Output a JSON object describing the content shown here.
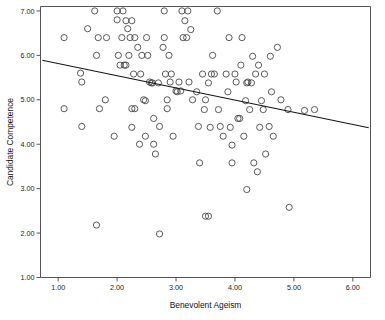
{
  "chart_data": {
    "type": "scatter",
    "title": "",
    "xlabel": "Benevolent Ageism",
    "ylabel": "Candidate Competence",
    "xlim": [
      0.7,
      6.3
    ],
    "ylim": [
      1.0,
      7.1
    ],
    "grid": false,
    "legend": null,
    "xticks": [
      "1.00",
      "2.00",
      "3.00",
      "4.00",
      "5.00",
      "6.00"
    ],
    "xtick_values": [
      1.0,
      2.0,
      3.0,
      4.0,
      5.0,
      6.0
    ],
    "yticks": [
      "1.00",
      "2.00",
      "3.00",
      "4.00",
      "5.00",
      "6.00",
      "7.00"
    ],
    "ytick_values": [
      1.0,
      2.0,
      3.0,
      4.0,
      5.0,
      6.0,
      7.0
    ],
    "marker": "open-circle",
    "marker_size": 3.1,
    "fit_line": {
      "type": "linear-regression",
      "x_start": 0.73,
      "y_start": 5.89,
      "x_end": 6.27,
      "y_end": 4.37,
      "slope": -0.274,
      "intercept": 6.09
    },
    "points": [
      [
        1.1,
        6.4
      ],
      [
        1.1,
        4.8
      ],
      [
        1.38,
        5.6
      ],
      [
        1.4,
        5.4
      ],
      [
        1.4,
        4.4
      ],
      [
        1.5,
        6.6
      ],
      [
        1.62,
        7.0
      ],
      [
        1.65,
        6.0
      ],
      [
        1.65,
        2.18
      ],
      [
        1.68,
        6.4
      ],
      [
        1.7,
        4.8
      ],
      [
        1.8,
        5.0
      ],
      [
        1.82,
        6.4
      ],
      [
        1.95,
        4.18
      ],
      [
        2.0,
        6.8
      ],
      [
        2.0,
        7.0
      ],
      [
        2.02,
        6.0
      ],
      [
        2.05,
        5.78
      ],
      [
        2.08,
        6.4
      ],
      [
        2.1,
        7.0
      ],
      [
        2.12,
        5.78
      ],
      [
        2.15,
        6.78
      ],
      [
        2.15,
        5.78
      ],
      [
        2.18,
        6.6
      ],
      [
        2.2,
        6.0
      ],
      [
        2.22,
        6.4
      ],
      [
        2.25,
        6.78
      ],
      [
        2.25,
        4.8
      ],
      [
        2.25,
        4.38
      ],
      [
        2.28,
        5.58
      ],
      [
        2.3,
        6.4
      ],
      [
        2.3,
        4.8
      ],
      [
        2.35,
        6.18
      ],
      [
        2.38,
        4.0
      ],
      [
        2.4,
        5.58
      ],
      [
        2.42,
        6.0
      ],
      [
        2.45,
        5.0
      ],
      [
        2.48,
        4.98
      ],
      [
        2.48,
        4.18
      ],
      [
        2.5,
        6.4
      ],
      [
        2.52,
        6.0
      ],
      [
        2.55,
        5.4
      ],
      [
        2.58,
        5.38
      ],
      [
        2.6,
        5.38
      ],
      [
        2.62,
        4.58
      ],
      [
        2.62,
        4.0
      ],
      [
        2.65,
        3.78
      ],
      [
        2.7,
        5.38
      ],
      [
        2.72,
        4.4
      ],
      [
        2.72,
        1.98
      ],
      [
        2.78,
        6.18
      ],
      [
        2.8,
        7.0
      ],
      [
        2.8,
        6.4
      ],
      [
        2.82,
        5.58
      ],
      [
        2.85,
        5.0
      ],
      [
        2.85,
        4.8
      ],
      [
        2.88,
        6.0
      ],
      [
        2.9,
        5.4
      ],
      [
        2.92,
        5.58
      ],
      [
        2.95,
        4.18
      ],
      [
        3.0,
        5.2
      ],
      [
        3.02,
        5.18
      ],
      [
        3.05,
        5.4
      ],
      [
        3.08,
        5.2
      ],
      [
        3.1,
        7.0
      ],
      [
        3.12,
        6.4
      ],
      [
        3.15,
        6.78
      ],
      [
        3.18,
        6.4
      ],
      [
        3.2,
        7.0
      ],
      [
        3.22,
        5.4
      ],
      [
        3.25,
        6.58
      ],
      [
        3.28,
        5.0
      ],
      [
        3.35,
        5.18
      ],
      [
        3.38,
        4.4
      ],
      [
        3.4,
        3.58
      ],
      [
        3.45,
        5.58
      ],
      [
        3.48,
        4.78
      ],
      [
        3.5,
        5.0
      ],
      [
        3.5,
        2.38
      ],
      [
        3.55,
        5.38
      ],
      [
        3.55,
        2.38
      ],
      [
        3.58,
        4.38
      ],
      [
        3.6,
        5.58
      ],
      [
        3.62,
        6.0
      ],
      [
        3.65,
        5.58
      ],
      [
        3.7,
        7.0
      ],
      [
        3.72,
        4.78
      ],
      [
        3.75,
        4.4
      ],
      [
        3.8,
        4.18
      ],
      [
        3.85,
        5.58
      ],
      [
        3.88,
        5.18
      ],
      [
        3.9,
        6.4
      ],
      [
        3.92,
        4.38
      ],
      [
        3.95,
        3.98
      ],
      [
        3.95,
        3.58
      ],
      [
        4.0,
        5.58
      ],
      [
        4.02,
        5.4
      ],
      [
        4.05,
        4.58
      ],
      [
        4.08,
        4.58
      ],
      [
        4.1,
        5.78
      ],
      [
        4.12,
        6.4
      ],
      [
        4.15,
        4.18
      ],
      [
        4.18,
        4.98
      ],
      [
        4.2,
        5.38
      ],
      [
        4.2,
        2.98
      ],
      [
        4.22,
        5.4
      ],
      [
        4.25,
        4.78
      ],
      [
        4.28,
        5.38
      ],
      [
        4.3,
        5.98
      ],
      [
        4.32,
        3.58
      ],
      [
        4.35,
        5.58
      ],
      [
        4.38,
        3.38
      ],
      [
        4.4,
        5.78
      ],
      [
        4.42,
        4.38
      ],
      [
        4.45,
        4.98
      ],
      [
        4.48,
        4.78
      ],
      [
        4.5,
        5.58
      ],
      [
        4.52,
        3.78
      ],
      [
        4.58,
        4.4
      ],
      [
        4.6,
        5.98
      ],
      [
        4.62,
        5.18
      ],
      [
        4.65,
        4.18
      ],
      [
        4.72,
        6.18
      ],
      [
        4.78,
        5.0
      ],
      [
        4.9,
        4.78
      ],
      [
        4.92,
        2.58
      ],
      [
        5.18,
        4.76
      ],
      [
        5.35,
        4.78
      ]
    ],
    "n_points": 128
  }
}
